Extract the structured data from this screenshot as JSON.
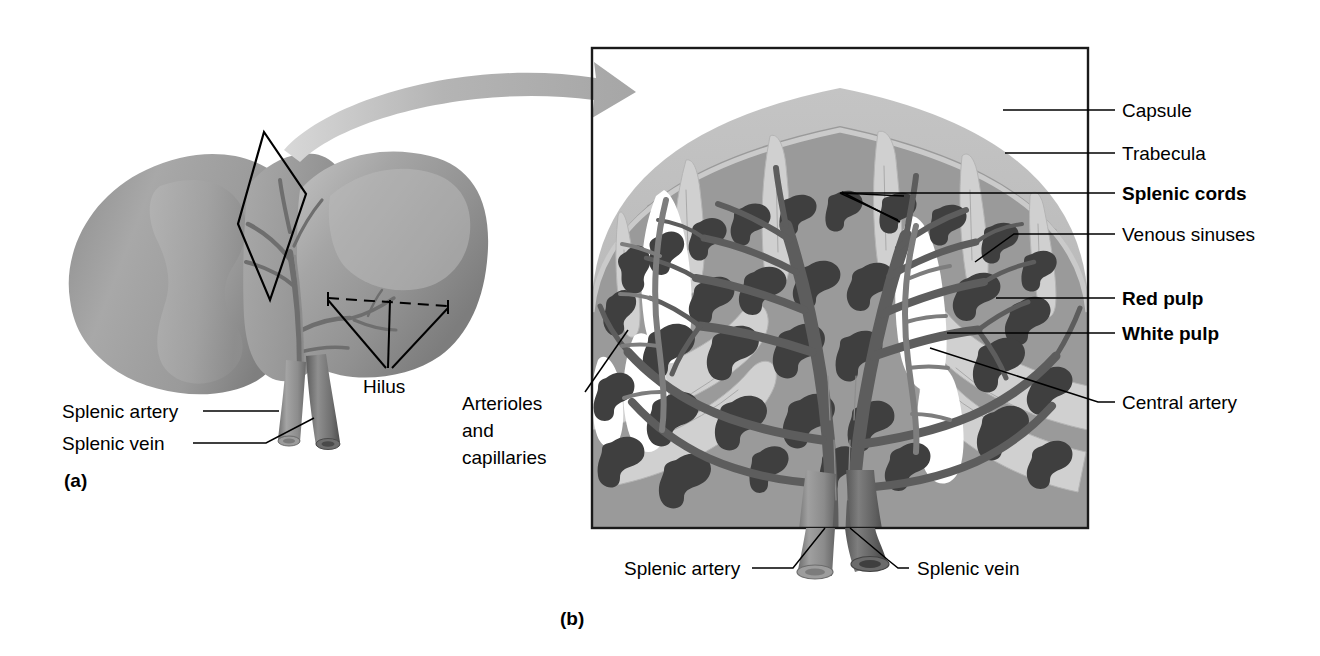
{
  "figure": {
    "panels": [
      {
        "tag": "(a)",
        "name": "gross-anatomy-of-spleen"
      },
      {
        "tag": "(b)",
        "name": "internal-structure-of-spleen"
      }
    ]
  },
  "panel_a": {
    "tag": "(a)",
    "labels": [
      {
        "id": "splenic-artery",
        "text": "Splenic artery",
        "bold": false
      },
      {
        "id": "splenic-vein",
        "text": "Splenic vein",
        "bold": false
      },
      {
        "id": "hilus",
        "text": "Hilus",
        "bold": false
      }
    ]
  },
  "panel_b": {
    "tag": "(b)",
    "labels": [
      {
        "id": "capsule",
        "text": "Capsule",
        "bold": false
      },
      {
        "id": "trabecula",
        "text": "Trabecula",
        "bold": false
      },
      {
        "id": "splenic-cords",
        "text": "Splenic cords",
        "bold": true
      },
      {
        "id": "venous-sinuses",
        "text": "Venous sinuses",
        "bold": false
      },
      {
        "id": "red-pulp",
        "text": "Red pulp",
        "bold": true
      },
      {
        "id": "white-pulp",
        "text": "White pulp",
        "bold": true
      },
      {
        "id": "central-artery",
        "text": "Central artery",
        "bold": false
      },
      {
        "id": "arterioles-and-capillaries-line1",
        "text": "Arterioles",
        "bold": false
      },
      {
        "id": "arterioles-and-capillaries-line2",
        "text": "and",
        "bold": false
      },
      {
        "id": "arterioles-and-capillaries-line3",
        "text": "capillaries",
        "bold": false
      },
      {
        "id": "splenic-artery-b",
        "text": "Splenic artery",
        "bold": false
      },
      {
        "id": "splenic-vein-b",
        "text": "Splenic vein",
        "bold": false
      }
    ]
  },
  "colors": {
    "background": "#ffffff",
    "ink": "#000000",
    "frame": "#1a1a1a",
    "capsule": "#b9b9b9",
    "capsule_light": "#d2d2d2",
    "red_pulp": "#9a9a9a",
    "white_pulp": "#ffffff",
    "trabecula": "#cfcfcf",
    "cords": "#4a4a4a",
    "vessel": "#7e7e7e",
    "vessel_dark": "#5b5b5b",
    "vein_dark": "#4f4f4f",
    "artery_mid": "#8c8c8c",
    "spleen_body": "#9d9d9d",
    "spleen_shade": "#868686",
    "spleen_light": "#b6b6b6",
    "arrow": "#b0b0b0"
  }
}
